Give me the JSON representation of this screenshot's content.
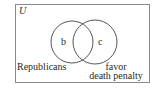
{
  "diagram": {
    "type": "venn",
    "universe": {
      "label": "U",
      "rect": {
        "x": 15.5,
        "y": 4.5,
        "width": 134,
        "height": 78
      },
      "stroke": "#8a8a8a"
    },
    "sets": [
      {
        "name": "Republicans",
        "label": "Republicans",
        "circle": {
          "cx": 72,
          "cy": 42,
          "r": 21
        },
        "stroke": "#555555"
      },
      {
        "name": "favor death penalty",
        "label_lines": [
          "favor",
          "death penalty"
        ],
        "circle": {
          "cx": 95,
          "cy": 42,
          "r": 22
        },
        "stroke": "#555555"
      }
    ],
    "regions": [
      {
        "label": "b",
        "position": "Republicans only"
      },
      {
        "label": "c",
        "position": "favor death penalty only"
      }
    ]
  }
}
